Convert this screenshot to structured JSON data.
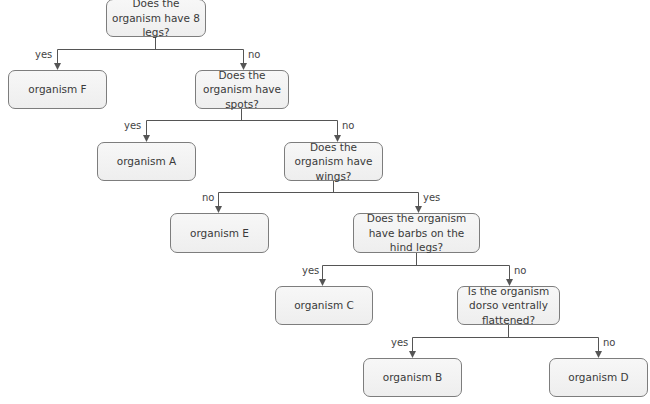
{
  "diagram": {
    "type": "dichotomous_key",
    "nodes": [
      {
        "id": "q1",
        "text": "Does the organism have 8 legs?",
        "kind": "question"
      },
      {
        "id": "f",
        "text": "organism F",
        "kind": "result"
      },
      {
        "id": "q2",
        "text": "Does the organism have spots?",
        "kind": "question"
      },
      {
        "id": "a",
        "text": "organism A",
        "kind": "result"
      },
      {
        "id": "q3",
        "text": "Does the organism have wings?",
        "kind": "question"
      },
      {
        "id": "e",
        "text": "organism E",
        "kind": "result"
      },
      {
        "id": "q4",
        "text": "Does the organism have barbs on the hind legs?",
        "kind": "question"
      },
      {
        "id": "c",
        "text": "organism C",
        "kind": "result"
      },
      {
        "id": "q5",
        "text": "Is the organism dorso ventrally flattened?",
        "kind": "question"
      },
      {
        "id": "b",
        "text": "organism B",
        "kind": "result"
      },
      {
        "id": "d",
        "text": "organism D",
        "kind": "result"
      }
    ],
    "edges": [
      {
        "from": "q1",
        "to": "f",
        "label": "yes"
      },
      {
        "from": "q1",
        "to": "q2",
        "label": "no"
      },
      {
        "from": "q2",
        "to": "a",
        "label": "yes"
      },
      {
        "from": "q2",
        "to": "q3",
        "label": "no"
      },
      {
        "from": "q3",
        "to": "e",
        "label": "no"
      },
      {
        "from": "q3",
        "to": "q4",
        "label": "yes"
      },
      {
        "from": "q4",
        "to": "c",
        "label": "yes"
      },
      {
        "from": "q4",
        "to": "q5",
        "label": "no"
      },
      {
        "from": "q5",
        "to": "b",
        "label": "yes"
      },
      {
        "from": "q5",
        "to": "d",
        "label": "no"
      }
    ]
  },
  "colors": {
    "line": "#555555",
    "box_border": "#7d7d7d",
    "box_fill": "#f2f2f2"
  }
}
